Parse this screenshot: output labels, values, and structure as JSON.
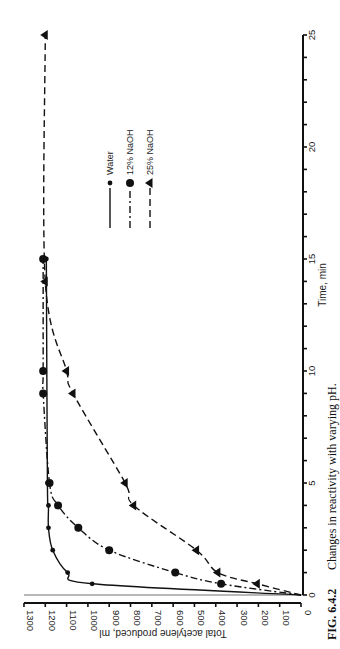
{
  "figure": {
    "caption_label": "FIG. 6.4.2",
    "caption_text": "Changes in reactivity with varying pH.",
    "orientation": "rotated 90° counter-clockwise"
  },
  "chart_data": {
    "type": "line",
    "title": "Changes in reactivity with varying pH.",
    "xlabel": "Time, min",
    "ylabel": "Total acetylene produced, ml",
    "xlim": [
      0,
      25
    ],
    "ylim": [
      0,
      1300
    ],
    "x_ticks": [
      0,
      5,
      10,
      15,
      20,
      25
    ],
    "x_minor_tick_step": 1,
    "y_ticks": [
      0,
      100,
      200,
      300,
      400,
      500,
      600,
      700,
      800,
      900,
      1000,
      1100,
      1200,
      1300
    ],
    "grid": false,
    "legend_position": "upper-middle",
    "series": [
      {
        "name": "Water",
        "marker": "small-circle",
        "line_style": "solid",
        "points": [
          [
            0,
            0
          ],
          [
            0.5,
            980
          ],
          [
            1,
            1095
          ],
          [
            2,
            1165
          ],
          [
            3,
            1185
          ],
          [
            4,
            1185
          ],
          [
            5,
            1190
          ],
          [
            15,
            1195
          ]
        ]
      },
      {
        "name": "12% NaOH",
        "marker": "large-circle",
        "line_style": "dash-dot",
        "points": [
          [
            0,
            0
          ],
          [
            0.5,
            375
          ],
          [
            1,
            590
          ],
          [
            2,
            900
          ],
          [
            3,
            1045
          ],
          [
            4,
            1140
          ],
          [
            5,
            1180
          ],
          [
            9,
            1210
          ],
          [
            10,
            1210
          ],
          [
            15,
            1210
          ]
        ]
      },
      {
        "name": "25% NaOH",
        "marker": "triangle",
        "line_style": "dashed",
        "points": [
          [
            0,
            0
          ],
          [
            0.5,
            205
          ],
          [
            1,
            390
          ],
          [
            2,
            490
          ],
          [
            4,
            785
          ],
          [
            5,
            825
          ],
          [
            9,
            1070
          ],
          [
            10,
            1100
          ],
          [
            14,
            1200
          ],
          [
            25,
            1200
          ]
        ]
      }
    ]
  },
  "legend": {
    "items": [
      {
        "label": "Water"
      },
      {
        "label": "12% NaOH"
      },
      {
        "label": "25% NaOH"
      }
    ]
  },
  "axes": {
    "x_label": "Time, min",
    "y_label": "Total acetylene produced, ml",
    "x_tick_labels": [
      "0",
      "5",
      "10",
      "15",
      "20",
      "25"
    ],
    "y_tick_labels": [
      "0",
      "100",
      "200",
      "300",
      "400",
      "500",
      "600",
      "700",
      "800",
      "900",
      "1000",
      "1100",
      "1200",
      "1300"
    ]
  }
}
